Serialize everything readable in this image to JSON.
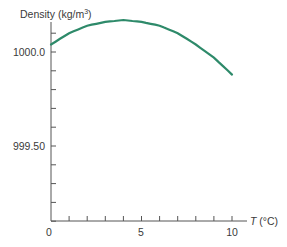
{
  "chart_data": {
    "type": "line",
    "title": "",
    "xlabel": "T (°C)",
    "ylabel": "Density (kg/m³)",
    "xlim": [
      0,
      10.8
    ],
    "ylim": [
      999.0,
      1000.2
    ],
    "x_ticks": [
      0,
      1,
      2,
      3,
      4,
      5,
      6,
      7,
      8,
      9,
      10
    ],
    "x_tick_labels": {
      "0": "0",
      "5": "5",
      "10": "10"
    },
    "y_ticks": [
      999.1,
      999.2,
      999.3,
      999.4,
      999.5,
      999.6,
      999.7,
      999.8,
      999.9,
      1000.0,
      1000.1
    ],
    "y_tick_labels": {
      "999.5": "999.50",
      "1000.0": "1000.0"
    },
    "grid": false,
    "legend": null,
    "series": [
      {
        "name": "Density of water",
        "color": "#2e8a6a",
        "x": [
          0,
          1,
          2,
          3,
          4,
          5,
          6,
          7,
          8,
          9,
          10
        ],
        "values": [
          1000.04,
          1000.1,
          1000.14,
          1000.16,
          1000.17,
          1000.16,
          1000.14,
          1000.1,
          1000.04,
          999.97,
          999.88
        ]
      }
    ]
  },
  "labels": {
    "ylabel_main": "Density (kg/m",
    "ylabel_sup": "3",
    "ylabel_close": ")",
    "xlabel_T": "T",
    "xlabel_unit": " (°C)",
    "y_1000": "1000.0",
    "y_999_50": "999.50",
    "x_0": "0",
    "x_5": "5",
    "x_10": "10"
  }
}
